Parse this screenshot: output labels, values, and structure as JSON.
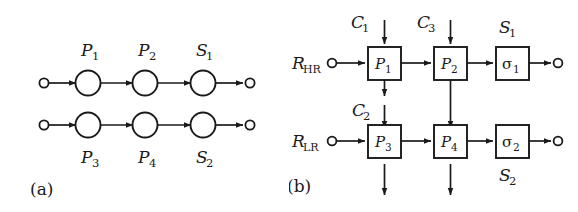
{
  "figure": {
    "background_color": "#ffffff",
    "stroke_color": "#1a1a1a",
    "panels": [
      {
        "id": "a",
        "caption": "(a)",
        "type": "pipeline-circles",
        "rows": [
          {
            "id": "row-top",
            "nodes": [
              {
                "id": "p1",
                "label": "P",
                "sub": "1",
                "label_position": "above"
              },
              {
                "id": "p2",
                "label": "P",
                "sub": "2",
                "label_position": "above"
              },
              {
                "id": "s1",
                "label": "S",
                "sub": "1",
                "label_position": "above"
              }
            ]
          },
          {
            "id": "row-bottom",
            "nodes": [
              {
                "id": "p3",
                "label": "P",
                "sub": "3",
                "label_position": "below"
              },
              {
                "id": "p4",
                "label": "P",
                "sub": "4",
                "label_position": "below"
              },
              {
                "id": "s2",
                "label": "S",
                "sub": "2",
                "label_position": "below"
              }
            ]
          }
        ]
      },
      {
        "id": "b",
        "caption": "(b)",
        "type": "block-diagram",
        "inputs": [
          {
            "id": "r-hr",
            "label": "R",
            "sub": "HR",
            "side": "left",
            "row": "top"
          },
          {
            "id": "r-lr",
            "label": "R",
            "sub": "LR",
            "side": "left",
            "row": "bottom"
          },
          {
            "id": "c1",
            "label": "C",
            "sub": "1",
            "side": "top",
            "target": "p1"
          },
          {
            "id": "c3",
            "label": "C",
            "sub": "3",
            "side": "top",
            "target": "p2"
          },
          {
            "id": "c2",
            "label": "C",
            "sub": "2",
            "side": "top",
            "target": "p3"
          }
        ],
        "blocks": [
          {
            "id": "p1",
            "label": "P",
            "sub": "1",
            "row": "top",
            "col": 1
          },
          {
            "id": "p2",
            "label": "P",
            "sub": "2",
            "row": "top",
            "col": 2
          },
          {
            "id": "sigma1",
            "label": "σ",
            "sub": "1",
            "row": "top",
            "col": 3,
            "outer_label": "S",
            "outer_sub": "1",
            "outer_position": "above"
          },
          {
            "id": "p3",
            "label": "P",
            "sub": "3",
            "row": "bottom",
            "col": 1
          },
          {
            "id": "p4",
            "label": "P",
            "sub": "4",
            "row": "bottom",
            "col": 2
          },
          {
            "id": "sigma2",
            "label": "σ",
            "sub": "2",
            "row": "bottom",
            "col": 3,
            "outer_label": "S",
            "outer_sub": "2",
            "outer_position": "below"
          }
        ],
        "couplings": [
          {
            "from": "p1",
            "to": "below",
            "kind": "output-down-short"
          },
          {
            "from": "p2",
            "to": "p4",
            "kind": "vertical-arrow"
          },
          {
            "from": "p3",
            "to": "below",
            "kind": "output-down"
          },
          {
            "from": "p4",
            "to": "below",
            "kind": "output-down"
          }
        ],
        "outputs": [
          {
            "id": "out-top",
            "from": "sigma1",
            "endpoint": "circle"
          },
          {
            "id": "out-bottom",
            "from": "sigma2",
            "endpoint": "circle"
          }
        ]
      }
    ]
  }
}
